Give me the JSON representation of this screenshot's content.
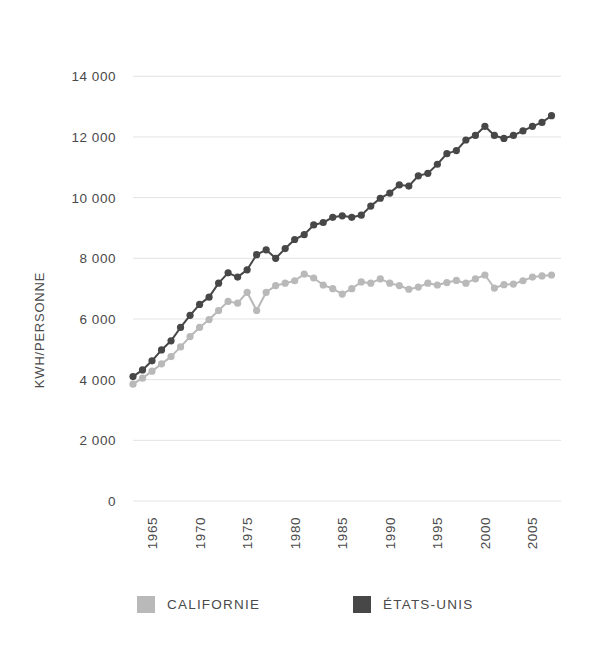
{
  "chart_data": {
    "type": "line",
    "title": "",
    "subtitle": "",
    "xlabel": "",
    "ylabel": "KWH/PERSONNE",
    "xlim": [
      1963,
      2008
    ],
    "ylim": [
      0,
      14800
    ],
    "yticks": [
      0,
      2000,
      4000,
      6000,
      8000,
      10000,
      12000,
      14000
    ],
    "ytick_labels": [
      "0",
      "2 000",
      "4 000",
      "6 000",
      "8 000",
      "10 000",
      "12 000",
      "14 000"
    ],
    "xticks": [
      1965,
      1970,
      1975,
      1980,
      1985,
      1990,
      1995,
      2000,
      2005
    ],
    "xtick_labels": [
      "1965",
      "1970",
      "1975",
      "1980",
      "1985",
      "1990",
      "1995",
      "2000",
      "2005"
    ],
    "xtick_rotation": 90,
    "grid": "horizontal",
    "markers": true,
    "legend_position": "bottom",
    "x": [
      1963,
      1964,
      1965,
      1966,
      1967,
      1968,
      1969,
      1970,
      1971,
      1972,
      1973,
      1974,
      1975,
      1976,
      1977,
      1978,
      1979,
      1980,
      1981,
      1982,
      1983,
      1984,
      1985,
      1986,
      1987,
      1988,
      1989,
      1990,
      1991,
      1992,
      1993,
      1994,
      1995,
      1996,
      1997,
      1998,
      1999,
      2000,
      2001,
      2002,
      2003,
      2004,
      2005,
      2006,
      2007
    ],
    "series": [
      {
        "name": "CALIFORNIE",
        "color": "#b9b9b9",
        "values": [
          3850,
          4050,
          4280,
          4520,
          4760,
          5080,
          5420,
          5720,
          5980,
          6280,
          6580,
          6520,
          6880,
          6280,
          6880,
          7100,
          7180,
          7260,
          7480,
          7350,
          7120,
          7000,
          6820,
          7000,
          7220,
          7180,
          7320,
          7180,
          7100,
          6980,
          7050,
          7180,
          7120,
          7200,
          7270,
          7180,
          7320,
          7450,
          7020,
          7130,
          7150,
          7260,
          7380,
          7420,
          7450
        ]
      },
      {
        "name": "ÉTATS-UNIS",
        "color": "#474747",
        "values": [
          4100,
          4320,
          4620,
          4980,
          5280,
          5720,
          6120,
          6480,
          6720,
          7180,
          7520,
          7380,
          7620,
          8120,
          8280,
          8000,
          8320,
          8620,
          8780,
          9100,
          9180,
          9350,
          9400,
          9350,
          9420,
          9720,
          9980,
          10150,
          10420,
          10380,
          10720,
          10800,
          11100,
          11450,
          11550,
          11900,
          12050,
          12350,
          12050,
          11950,
          12050,
          12200,
          12350,
          12480,
          12700
        ]
      }
    ]
  },
  "legend": {
    "items": [
      {
        "label": "CALIFORNIE",
        "color": "#b9b9b9"
      },
      {
        "label": "ÉTATS-UNIS",
        "color": "#474747"
      }
    ]
  },
  "axis": {
    "y_title": "KWH/PERSONNE"
  }
}
